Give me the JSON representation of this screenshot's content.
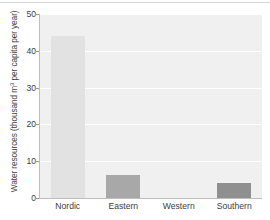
{
  "chart_data": {
    "type": "bar",
    "title": "",
    "xlabel": "",
    "ylabel": "Water resources (thousand m3 per capita per year)",
    "ylabel_prefix": "Water resources (thousand m",
    "ylabel_superscript": "3",
    "ylabel_suffix": " per capita per year)",
    "categories": [
      "Nordic",
      "Eastern",
      "Western",
      "Southern"
    ],
    "values": [
      44,
      6.3,
      0,
      4
    ],
    "bar_colors": [
      "#e2e2e2",
      "#a8a8a8",
      "#f0f0f0",
      "#8f8f8f"
    ],
    "ylim": [
      0,
      50
    ],
    "yticks": [
      0,
      10,
      20,
      30,
      40,
      50
    ],
    "ytick_labels": [
      "0",
      "10",
      "20",
      "30",
      "40",
      "50"
    ],
    "grid": true,
    "grid_color": "#ffffff",
    "plot_background": "#f0f0f0",
    "legend": null
  }
}
